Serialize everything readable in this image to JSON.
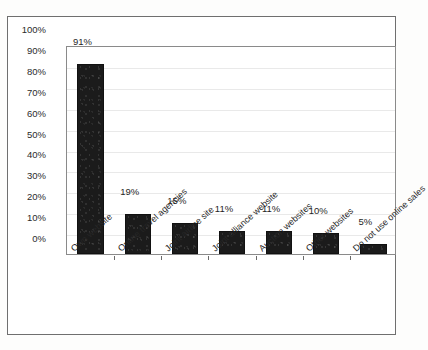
{
  "figure": {
    "caption_remnant": "",
    "background_color": "#ffffff",
    "frame_color": "#6f6f6f",
    "bar_color": "#1b1b1b",
    "gridline_color": "#e9e9e9"
  },
  "chart_data": {
    "type": "bar",
    "title": "",
    "subtitle": "",
    "xlabel": "",
    "ylabel": "",
    "ylim": [
      0,
      100
    ],
    "ytick_step": 10,
    "grid": true,
    "legend": false,
    "value_suffix": "%",
    "categories": [
      "Own website",
      "Online travel agencies",
      "Joint airline site",
      "Joint alliance website",
      "Auction websites",
      "Other websites",
      "Do not use online sales"
    ],
    "values": [
      91,
      19,
      15,
      11,
      11,
      10,
      5
    ],
    "value_labels": [
      "91%",
      "19%",
      "15%",
      "11%",
      "11%",
      "10%",
      "5%"
    ],
    "ytick_labels": [
      "100%",
      "90%",
      "80%",
      "70%",
      "60%",
      "50%",
      "40%",
      "30%",
      "20%",
      "10%",
      "0%"
    ],
    "ytick_values": [
      100,
      90,
      80,
      70,
      60,
      50,
      40,
      30,
      20,
      10,
      0
    ]
  }
}
